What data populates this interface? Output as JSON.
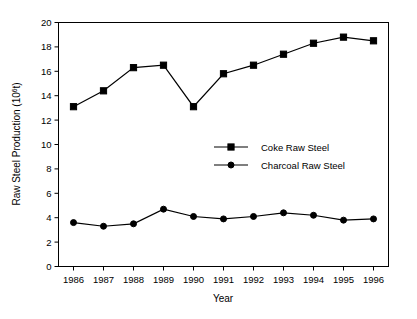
{
  "chart_data": {
    "type": "line",
    "title": "",
    "xlabel": "Year",
    "ylabel": "Raw Steel Production (10",
    "ylabel_sup": "6",
    "ylabel_tail": "t)",
    "categories": [
      "1986",
      "1987",
      "1988",
      "1989",
      "1990",
      "1991",
      "1992",
      "1993",
      "1994",
      "1995",
      "1996"
    ],
    "x": [
      1986,
      1987,
      1988,
      1989,
      1990,
      1991,
      1992,
      1993,
      1994,
      1995,
      1996
    ],
    "xlim": [
      1985.5,
      1996.5
    ],
    "ylim": [
      0,
      20
    ],
    "yticks": [
      0,
      2,
      4,
      6,
      8,
      10,
      12,
      14,
      16,
      18,
      20
    ],
    "ytick_labels": [
      "0",
      "2",
      "4",
      "6",
      "8",
      "10",
      "12",
      "14",
      "16",
      "18",
      "20"
    ],
    "grid": false,
    "legend_position": "center-right",
    "series": [
      {
        "name": "Coke Raw Steel",
        "marker": "square",
        "values": [
          13.1,
          14.4,
          16.3,
          16.5,
          13.1,
          15.8,
          16.5,
          17.4,
          18.3,
          18.8,
          18.5
        ]
      },
      {
        "name": "Charcoal Raw Steel",
        "marker": "circle",
        "values": [
          3.6,
          3.3,
          3.5,
          4.7,
          4.1,
          3.9,
          4.1,
          4.4,
          4.2,
          3.8,
          3.9
        ]
      }
    ]
  },
  "legend": {
    "items": [
      {
        "label": "Coke Raw Steel",
        "marker": "square"
      },
      {
        "label": "Charcoal Raw Steel",
        "marker": "circle"
      }
    ]
  },
  "axes": {
    "x_title": "Year",
    "y_title_main": "Raw Steel Production (10",
    "y_title_sup": "6",
    "y_title_tail": "t)"
  },
  "colors": {
    "ink": "#000000",
    "background": "#ffffff"
  }
}
